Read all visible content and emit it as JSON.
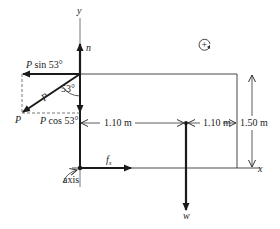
{
  "figure": {
    "type": "free-body diagram",
    "colors": {
      "line": "#333333",
      "vector": "#1a1a1a",
      "dashed": "#555555",
      "background": "#ffffff"
    },
    "axes": {
      "y_label": "y",
      "x_label": "x",
      "origin_label": "axis"
    },
    "forces": {
      "normal": "n",
      "friction": "f",
      "friction_sub": "s",
      "weight": "w",
      "applied": "P",
      "applied_horizontal": "P sin 53°",
      "applied_vertical": "P cos 53°",
      "angle": "53°",
      "applied_small_label": "P"
    },
    "dimensions": {
      "left_span": "1.10 m",
      "right_span": "1.10 m",
      "height": "1.50 m"
    },
    "rotation_symbol": "+"
  }
}
